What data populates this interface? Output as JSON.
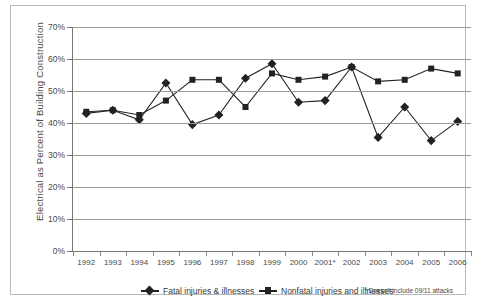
{
  "chart_data": {
    "type": "line",
    "title": "",
    "xlabel": "",
    "ylabel": "Electrical as Percent of Building Construction",
    "ylim": [
      0,
      70
    ],
    "ytick_labels": [
      "0%",
      "10%",
      "20%",
      "30%",
      "40%",
      "50%",
      "60%",
      "70%"
    ],
    "ytick_values": [
      0,
      10,
      20,
      30,
      40,
      50,
      60,
      70
    ],
    "grid": true,
    "legend_position": "bottom",
    "categories": [
      "1992",
      "1993",
      "1994",
      "1995",
      "1996",
      "1997",
      "1998",
      "1999",
      "2000",
      "2001*",
      "2002",
      "2003",
      "2004",
      "2005",
      "2006"
    ],
    "series": [
      {
        "name": "Fatal injuries & illnesses",
        "marker": "diamond",
        "color": "#222222",
        "values": [
          43.0,
          44.0,
          41.0,
          52.5,
          39.5,
          42.5,
          54.0,
          58.5,
          46.5,
          47.0,
          57.5,
          35.5,
          45.0,
          34.5,
          40.5
        ]
      },
      {
        "name": "Nonfatal injuries and illnesses",
        "marker": "square",
        "color": "#222222",
        "values": [
          43.5,
          44.0,
          42.5,
          47.0,
          53.5,
          53.5,
          45.0,
          55.5,
          53.5,
          54.5,
          57.5,
          53.0,
          53.5,
          57.0,
          55.5
        ]
      }
    ],
    "footnote": "* Doesn't include 09/11 attacks"
  }
}
